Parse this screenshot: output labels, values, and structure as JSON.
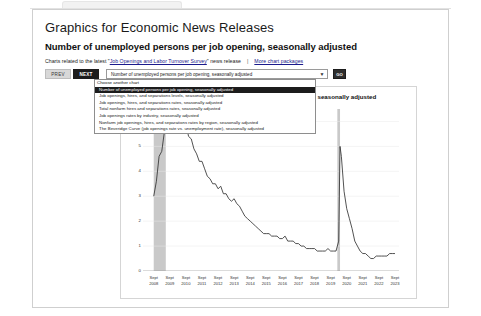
{
  "browser": {
    "tab_placeholder": ""
  },
  "page": {
    "title": "Graphics for Economic News Releases",
    "chart_heading": "Number of unemployed persons per job opening, seasonally adjusted",
    "related_prefix": "Charts related to the latest \"",
    "related_link": "Job Openings and Labor Turnover Survey",
    "related_suffix": "\" news release",
    "separator": "|",
    "more_link": "More chart packages"
  },
  "controls": {
    "prev_label": "PREV",
    "next_label": "NEXT",
    "go_label": "GO",
    "select_value": "Number of unemployed persons per job opening, seasonally adjusted",
    "arrow_icon": "▼"
  },
  "dropdown": {
    "open": true,
    "options": [
      "Choose another chart",
      "Number of unemployed persons per job opening, seasonally adjusted",
      "Job openings, hires, and separations levels, seasonally adjusted",
      "Job openings, hires, and separations rates, seasonally adjusted",
      "Total nonfarm hires and separations rates, seasonally adjusted",
      "Job openings rates by industry, seasonally adjusted",
      "Nonfarm job openings, hires, and separations rates by region, seasonally adjusted",
      "The Beveridge Curve (job openings rate vs. unemployment rate), seasonally adjusted"
    ],
    "selected_index": 1
  },
  "chart_data": {
    "type": "line",
    "title": "Number of unemployed persons per job opening, seasonally adjusted",
    "xlabel": "",
    "ylabel": "",
    "ylim": [
      0,
      6.5
    ],
    "yticks": [
      0,
      1,
      2,
      3,
      4,
      5,
      6
    ],
    "grid": true,
    "legend": "none",
    "tick_month": "Sept",
    "xtick_years": [
      "2008",
      "2009",
      "2010",
      "2011",
      "2012",
      "2013",
      "2014",
      "2015",
      "2016",
      "2017",
      "2018",
      "2019",
      "2020",
      "2021",
      "2022",
      "2023"
    ],
    "recession_bands": [
      {
        "start": "2008-09",
        "end": "2009-06",
        "label": "recession"
      },
      {
        "start": "2020-02",
        "end": "2020-04",
        "label": "recession"
      }
    ],
    "series": [
      {
        "name": "Unemployed persons per job opening",
        "color": "#333333",
        "x": [
          "2008-09",
          "2008-11",
          "2009-01",
          "2009-03",
          "2009-05",
          "2009-07",
          "2009-09",
          "2009-11",
          "2010-01",
          "2010-03",
          "2010-05",
          "2010-07",
          "2010-09",
          "2010-11",
          "2011-01",
          "2011-03",
          "2011-05",
          "2011-07",
          "2011-09",
          "2011-11",
          "2012-01",
          "2012-03",
          "2012-05",
          "2012-07",
          "2012-09",
          "2012-11",
          "2013-01",
          "2013-03",
          "2013-05",
          "2013-07",
          "2013-09",
          "2013-11",
          "2014-01",
          "2014-03",
          "2014-05",
          "2014-07",
          "2014-09",
          "2014-11",
          "2015-01",
          "2015-03",
          "2015-05",
          "2015-07",
          "2015-09",
          "2015-11",
          "2016-01",
          "2016-03",
          "2016-05",
          "2016-07",
          "2016-09",
          "2016-11",
          "2017-01",
          "2017-03",
          "2017-05",
          "2017-07",
          "2017-09",
          "2017-11",
          "2018-01",
          "2018-03",
          "2018-05",
          "2018-07",
          "2018-09",
          "2018-11",
          "2019-01",
          "2019-03",
          "2019-05",
          "2019-07",
          "2019-09",
          "2019-11",
          "2020-01",
          "2020-03",
          "2020-04",
          "2020-05",
          "2020-07",
          "2020-09",
          "2020-11",
          "2021-01",
          "2021-03",
          "2021-05",
          "2021-07",
          "2021-09",
          "2021-11",
          "2022-01",
          "2022-03",
          "2022-05",
          "2022-07",
          "2022-09",
          "2022-11",
          "2023-01",
          "2023-03",
          "2023-05",
          "2023-07",
          "2023-09"
        ],
        "values": [
          3.0,
          3.6,
          4.6,
          4.8,
          5.6,
          5.8,
          6.1,
          6.2,
          6.3,
          5.9,
          6.3,
          5.7,
          5.9,
          5.4,
          5.3,
          4.9,
          4.7,
          4.4,
          4.4,
          4.1,
          3.8,
          3.7,
          3.5,
          3.5,
          3.3,
          3.4,
          3.1,
          3.1,
          2.9,
          2.8,
          2.9,
          2.7,
          2.6,
          2.4,
          2.2,
          2.1,
          2.0,
          1.9,
          1.8,
          1.7,
          1.6,
          1.5,
          1.5,
          1.5,
          1.4,
          1.4,
          1.4,
          1.3,
          1.3,
          1.4,
          1.2,
          1.2,
          1.2,
          1.1,
          1.1,
          1.0,
          1.0,
          0.9,
          0.9,
          0.9,
          0.9,
          0.8,
          0.8,
          0.8,
          0.8,
          0.9,
          0.8,
          0.8,
          0.8,
          1.2,
          5.0,
          4.6,
          3.2,
          2.5,
          2.1,
          1.7,
          1.2,
          1.0,
          0.8,
          0.7,
          0.7,
          0.6,
          0.5,
          0.5,
          0.6,
          0.6,
          0.6,
          0.6,
          0.6,
          0.7,
          0.7,
          0.7
        ]
      }
    ]
  }
}
